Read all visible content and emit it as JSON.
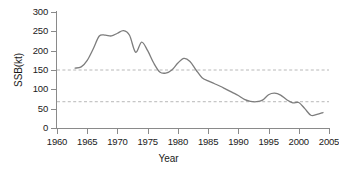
{
  "chart_data": {
    "type": "line",
    "title": "",
    "xlabel": "Year",
    "ylabel": "SSB(kt)",
    "xlim": [
      1960,
      2005
    ],
    "ylim": [
      0,
      300
    ],
    "grid": false,
    "legend": "none",
    "x_ticks": [
      1960,
      1965,
      1970,
      1975,
      1980,
      1985,
      1990,
      1995,
      2000,
      2005
    ],
    "y_ticks": [
      0,
      50,
      100,
      150,
      200,
      250,
      300
    ],
    "line_color": "#7d7d7d",
    "reference_line_color": "#b0b0b0",
    "reference_lines": [
      {
        "name": "upper-reference-line",
        "value": 150,
        "style": "dashed"
      },
      {
        "name": "lower-reference-line",
        "value": 68,
        "style": "dashed"
      }
    ],
    "series": [
      {
        "name": "SSB",
        "x": [
          1963,
          1964,
          1965,
          1966,
          1967,
          1968,
          1969,
          1970,
          1971,
          1972,
          1973,
          1974,
          1975,
          1976,
          1977,
          1978,
          1979,
          1980,
          1981,
          1982,
          1983,
          1984,
          1985,
          1986,
          1987,
          1988,
          1989,
          1990,
          1991,
          1992,
          1993,
          1994,
          1995,
          1996,
          1997,
          1998,
          1999,
          2000,
          2001,
          2002,
          2003,
          2004
        ],
        "values": [
          155,
          158,
          175,
          205,
          238,
          240,
          238,
          245,
          252,
          240,
          196,
          222,
          200,
          168,
          145,
          142,
          150,
          168,
          180,
          172,
          150,
          130,
          122,
          115,
          108,
          100,
          92,
          84,
          74,
          69,
          68,
          72,
          86,
          90,
          85,
          73,
          65,
          66,
          50,
          33,
          35,
          40
        ]
      }
    ]
  }
}
